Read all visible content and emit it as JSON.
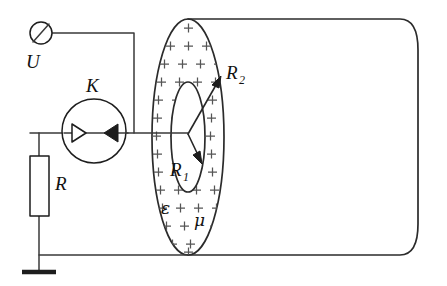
{
  "figure": {
    "background_color": "#ffffff",
    "line_color": "#2b2b2b",
    "charge_color": "#555555",
    "width": 447,
    "height": 286
  },
  "labels": {
    "voltage_source": "U",
    "meter": "K",
    "resistor": "R",
    "inner_radius": "R",
    "inner_radius_sub": "1",
    "outer_radius": "R",
    "outer_radius_sub": "2",
    "permittivity": "ε",
    "permeability": "μ"
  },
  "components": {
    "terminal": {
      "name": "voltage-terminal",
      "shape": "circle-with-slash",
      "cx": 41,
      "cy": 33,
      "r": 11
    },
    "meter": {
      "name": "galvanometer",
      "shape": "circle-with-two-arrowheads",
      "cx": 94,
      "cy": 131,
      "r": 32,
      "arrowhead_left_style": "hollow",
      "arrowhead_right_style": "filled"
    },
    "resistor": {
      "name": "resistor-box",
      "x": 30,
      "y": 156,
      "width": 19,
      "height": 60
    },
    "ground": {
      "name": "ground-symbol",
      "x": 39,
      "y": 272,
      "bar_width": 34
    },
    "outer_cylinder": {
      "name": "dielectric-cylinder",
      "ellipse_cx": 188,
      "ellipse_cy": 137,
      "ellipse_rx": 36,
      "ellipse_ry": 118,
      "body_right_x": 418
    },
    "inner_electrode": {
      "name": "inner-conductor-ellipse",
      "cx": 188,
      "cy": 137,
      "rx": 17,
      "ry": 55
    }
  },
  "charge_marks": {
    "symbol": "+",
    "description": "plus charges filling the annulus between inner and outer ellipse",
    "spacing_x": 18,
    "spacing_y": 18,
    "count_approx": 70
  },
  "arrows": [
    {
      "name": "outer-radius-arrow",
      "label_key": "outer_radius",
      "from_x": 188,
      "from_y": 134,
      "to_x": 220,
      "to_y": 79,
      "head": "filled"
    },
    {
      "name": "inner-radius-arrow",
      "label_key": "inner_radius",
      "from_x": 188,
      "from_y": 134,
      "to_x": 200,
      "to_y": 160,
      "head": "filled"
    }
  ],
  "label_positions": {
    "voltage_source": {
      "x": 26,
      "y": 68
    },
    "meter": {
      "x": 86,
      "y": 92
    },
    "resistor": {
      "x": 55,
      "y": 190
    },
    "inner_radius": {
      "x": 172,
      "y": 176
    },
    "outer_radius": {
      "x": 228,
      "y": 79
    },
    "permittivity": {
      "x": 161,
      "y": 214
    },
    "permeability": {
      "x": 194,
      "y": 226
    }
  }
}
